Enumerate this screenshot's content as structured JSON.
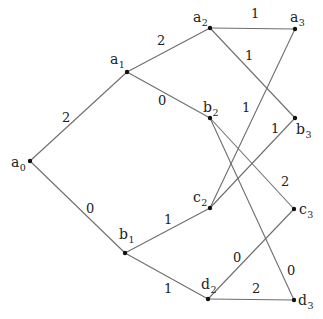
{
  "diagram": {
    "type": "weighted-graph",
    "colors": {
      "edge": "#6e6e6e",
      "node": "#111111",
      "text": "#222222",
      "background": "#ffffff"
    },
    "nodes": [
      {
        "id": "a0",
        "base": "a",
        "sub": "0",
        "x": 30,
        "y": 161,
        "lx": 11,
        "ly": 167
      },
      {
        "id": "a1",
        "base": "a",
        "sub": "1",
        "x": 127,
        "y": 72,
        "lx": 110,
        "ly": 64
      },
      {
        "id": "a2",
        "base": "a",
        "sub": "2",
        "x": 210,
        "y": 28,
        "lx": 193,
        "ly": 22
      },
      {
        "id": "a3",
        "base": "a",
        "sub": "3",
        "x": 295,
        "y": 29,
        "lx": 290,
        "ly": 22
      },
      {
        "id": "b1",
        "base": "b",
        "sub": "1",
        "x": 125,
        "y": 253,
        "lx": 119,
        "ly": 239
      },
      {
        "id": "b2",
        "base": "b",
        "sub": "2",
        "x": 210,
        "y": 118,
        "lx": 203,
        "ly": 112
      },
      {
        "id": "b3",
        "base": "b",
        "sub": "3",
        "x": 295,
        "y": 118,
        "lx": 296,
        "ly": 134
      },
      {
        "id": "c2",
        "base": "c",
        "sub": "2",
        "x": 210,
        "y": 208,
        "lx": 193,
        "ly": 202
      },
      {
        "id": "c3",
        "base": "c",
        "sub": "3",
        "x": 294,
        "y": 209,
        "lx": 299,
        "ly": 214
      },
      {
        "id": "d2",
        "base": "d",
        "sub": "2",
        "x": 208,
        "y": 299,
        "lx": 201,
        "ly": 289
      },
      {
        "id": "d3",
        "base": "d",
        "sub": "3",
        "x": 294,
        "y": 300,
        "lx": 298,
        "ly": 305
      }
    ],
    "edges": [
      {
        "from": "a0",
        "to": "a1",
        "weight": "2",
        "wx": 62,
        "wy": 122
      },
      {
        "from": "a0",
        "to": "b1",
        "weight": "0",
        "wx": 86,
        "wy": 213
      },
      {
        "from": "a1",
        "to": "a2",
        "weight": "2",
        "wx": 157,
        "wy": 45
      },
      {
        "from": "a1",
        "to": "b2",
        "weight": "0",
        "wx": 158,
        "wy": 105
      },
      {
        "from": "b1",
        "to": "c2",
        "weight": "1",
        "wx": 164,
        "wy": 224
      },
      {
        "from": "b1",
        "to": "d2",
        "weight": "1",
        "wx": 164,
        "wy": 293
      },
      {
        "from": "a2",
        "to": "a3",
        "weight": "1",
        "wx": 251,
        "wy": 18
      },
      {
        "from": "a2",
        "to": "b3",
        "weight": "1",
        "wx": 245,
        "wy": 60
      },
      {
        "from": "b2",
        "to": "c3",
        "weight": "2",
        "wx": 281,
        "wy": 186
      },
      {
        "from": "b2",
        "to": "d3",
        "weight": "0",
        "wx": 287,
        "wy": 275
      },
      {
        "from": "c2",
        "to": "a3",
        "weight": "1",
        "wx": 242,
        "wy": 112
      },
      {
        "from": "c2",
        "to": "b3",
        "weight": "1",
        "wx": 271,
        "wy": 133
      },
      {
        "from": "d2",
        "to": "c3",
        "weight": "0",
        "wx": 233,
        "wy": 262
      },
      {
        "from": "d2",
        "to": "d3",
        "weight": "2",
        "wx": 252,
        "wy": 293
      }
    ]
  }
}
